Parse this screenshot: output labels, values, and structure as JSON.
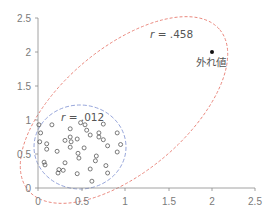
{
  "chart_data": {
    "type": "scatter",
    "title": "",
    "xlabel": "",
    "ylabel": "",
    "xlim": [
      0,
      2.5
    ],
    "ylim": [
      0,
      2.5
    ],
    "grid": false,
    "legend": null,
    "x_ticks": [
      "0",
      "0.5",
      "1",
      "1.5",
      "2",
      "2.5"
    ],
    "y_ticks": [
      "0",
      "0.5",
      "1",
      "1.5",
      "2",
      "2.5"
    ],
    "series": [
      {
        "name": "cluster",
        "marker": "open-circle",
        "points": [
          [
            0.01,
            0.93
          ],
          [
            0.03,
            0.81
          ],
          [
            0.02,
            0.68
          ],
          [
            0.16,
            0.93
          ],
          [
            0.1,
            0.65
          ],
          [
            0.1,
            0.57
          ],
          [
            0.07,
            0.38
          ],
          [
            0.08,
            0.34
          ],
          [
            0.22,
            0.54
          ],
          [
            0.37,
            0.87
          ],
          [
            0.31,
            0.7
          ],
          [
            0.37,
            0.75
          ],
          [
            0.38,
            0.68
          ],
          [
            0.37,
            0.6
          ],
          [
            0.31,
            0.37
          ],
          [
            0.29,
            0.26
          ],
          [
            0.24,
            0.27
          ],
          [
            0.23,
            0.22
          ],
          [
            0.45,
            0.72
          ],
          [
            0.49,
            0.96
          ],
          [
            0.54,
            0.93
          ],
          [
            0.56,
            0.85
          ],
          [
            0.6,
            0.78
          ],
          [
            0.53,
            0.59
          ],
          [
            0.46,
            0.51
          ],
          [
            0.47,
            0.44
          ],
          [
            0.45,
            0.21
          ],
          [
            0.6,
            0.28
          ],
          [
            0.62,
            0.1
          ],
          [
            0.75,
            0.94
          ],
          [
            0.7,
            0.81
          ],
          [
            0.7,
            0.75
          ],
          [
            0.75,
            0.71
          ],
          [
            0.8,
            0.62
          ],
          [
            0.67,
            0.47
          ],
          [
            0.66,
            0.4
          ],
          [
            0.78,
            0.33
          ],
          [
            0.8,
            0.22
          ],
          [
            0.91,
            0.81
          ],
          [
            0.95,
            0.64
          ],
          [
            0.91,
            0.53
          ]
        ]
      },
      {
        "name": "outlier",
        "marker": "filled-circle",
        "points": [
          [
            2.0,
            2.0
          ]
        ]
      }
    ],
    "ellipses": [
      {
        "name": "cluster-ellipse",
        "color": "#8a9bd6",
        "style": "dashed",
        "cx": 0.48,
        "cy": 0.6,
        "rx": 0.55,
        "ry": 0.65
      },
      {
        "name": "all-data-ellipse",
        "color": "#e8847a",
        "style": "dashed"
      }
    ],
    "annotations": [
      {
        "text": "r = .012",
        "italic_prefix": "r",
        "rest": " = .012",
        "x": 0.28,
        "y": 1.0
      },
      {
        "text": "r = .458",
        "italic_prefix": "r",
        "rest": " = .458",
        "x": 1.3,
        "y": 2.13
      },
      {
        "text": "外れ値",
        "x": 1.9,
        "y": 1.78
      }
    ]
  }
}
